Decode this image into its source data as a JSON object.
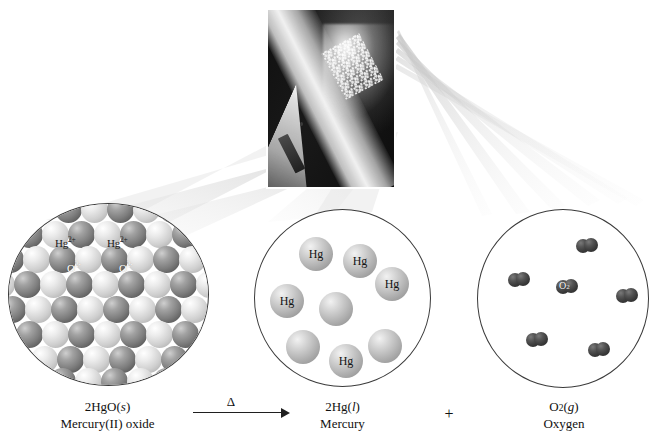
{
  "figure": {
    "background_color": "#ffffff"
  },
  "photo": {
    "name": "heated-test-tube-photograph",
    "description": "Test tube of mercury(II) oxide heated over a flame with mercury droplets condensing",
    "frame_color": "#131313"
  },
  "magnifications": [
    {
      "id": "hgo",
      "name": "mercury-oxide-lattice",
      "view": "ionic crystal lattice of alternating ions",
      "ion_labels": [
        "Hg2+",
        "Hg2+",
        "O2-",
        "O2-"
      ],
      "cation_symbol": "Hg",
      "cation_charge": "2+",
      "anion_symbol": "O",
      "anion_charge": "2-",
      "cation_color": "#7d7d7d",
      "anion_color": "#cfcfcf"
    },
    {
      "id": "hg",
      "name": "mercury-atoms",
      "view": "individual mercury atoms in liquid",
      "atom_symbol": "Hg",
      "atom_count": 8,
      "labeled_count": 5,
      "atom_color": "#b6b6b6"
    },
    {
      "id": "o2",
      "name": "oxygen-molecules",
      "view": "diatomic oxygen molecules in gas",
      "molecule_symbol": "O2",
      "molecule_count": 6,
      "labeled_count": 1,
      "molecule_color": "#3a3a3a"
    }
  ],
  "equation": {
    "reactant": {
      "formula_prefix": "2HgO",
      "state": "(s)",
      "state_letter": "s",
      "name": "Mercury(II) oxide"
    },
    "arrow": {
      "condition_symbol": "Δ",
      "meaning": "heat"
    },
    "products": [
      {
        "formula_prefix": "2Hg",
        "state": "(l)",
        "state_letter": "l",
        "name": "Mercury"
      },
      {
        "formula_prefix": "O",
        "subscript": "2",
        "state": "(g)",
        "state_letter": "g",
        "name": "Oxygen"
      }
    ],
    "operator": "+"
  }
}
